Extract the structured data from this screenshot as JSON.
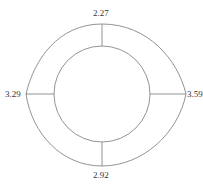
{
  "header": {
    "text": ""
  },
  "diagram": {
    "type": "radial-ring",
    "labels": {
      "top": "2.27",
      "right": "3.59",
      "bottom": "2.92",
      "left": "3.29"
    }
  }
}
